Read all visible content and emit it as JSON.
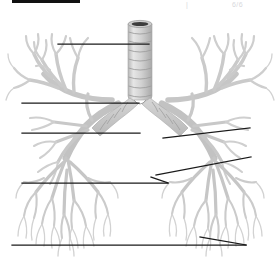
{
  "page": {
    "width": 280,
    "height": 272,
    "background": "#ffffff",
    "kind": "unlabeled-anatomy-diagram"
  },
  "header": {
    "redaction_bar_label": "",
    "faint_marks": [
      {
        "text": "|",
        "x": 186,
        "y": 1
      },
      {
        "text": "6/6",
        "x": 232,
        "y": 1
      }
    ]
  },
  "figure": {
    "structures": [
      {
        "name": "trachea",
        "note": "central vertical airway with cartilage rings"
      },
      {
        "name": "tracheal-lumen",
        "note": "dark ellipse at superior cut end"
      },
      {
        "name": "carina",
        "note": "bifurcation point"
      },
      {
        "name": "right-main-bronchus",
        "note": "viewer left"
      },
      {
        "name": "left-main-bronchus",
        "note": "viewer right"
      },
      {
        "name": "right-bronchial-tree",
        "note": "viewer left branching field"
      },
      {
        "name": "left-bronchial-tree",
        "note": "viewer right branching field"
      }
    ]
  },
  "colors": {
    "line": "#1a1a1a",
    "tissue_light": "#dcdcdc",
    "tissue_mid": "#c4c4c4",
    "tissue_dark": "#a8a8a8",
    "cartilage": "#cfcfcf",
    "cartilage_edge": "#9a9a9a",
    "lumen": "#3a3a3a",
    "background": "#ffffff",
    "ghost_text": "#d8d8dc"
  },
  "leader_lines": [
    {
      "id": 1,
      "label": "",
      "style": "horizontal",
      "x1": 58,
      "y1": 44,
      "x2": 149,
      "y2": 44,
      "anchor_side": "left"
    },
    {
      "id": 2,
      "label": "",
      "style": "horizontal",
      "x1": 22,
      "y1": 103,
      "x2": 139,
      "y2": 103,
      "anchor_side": "left"
    },
    {
      "id": 3,
      "label": "",
      "style": "horizontal",
      "x1": 22,
      "y1": 133,
      "x2": 140,
      "y2": 133,
      "anchor_side": "left"
    },
    {
      "id": 4,
      "label": "",
      "style": "angled",
      "x1": 250,
      "y1": 128,
      "x2": 163,
      "y2": 138,
      "anchor_side": "right"
    },
    {
      "id": 5,
      "label": "",
      "style": "angled",
      "x1": 251,
      "y1": 157,
      "x2": 156,
      "y2": 175,
      "anchor_side": "right"
    },
    {
      "id": 6,
      "label": "",
      "style": "horizontal-pointer",
      "x1": 22,
      "y1": 183,
      "x2": 168,
      "y2": 183,
      "anchor_side": "left"
    },
    {
      "id": 7,
      "label": "",
      "style": "horizontal-pointer",
      "x1": 12,
      "y1": 245,
      "x2": 246,
      "y2": 245,
      "anchor_side": "left"
    }
  ]
}
